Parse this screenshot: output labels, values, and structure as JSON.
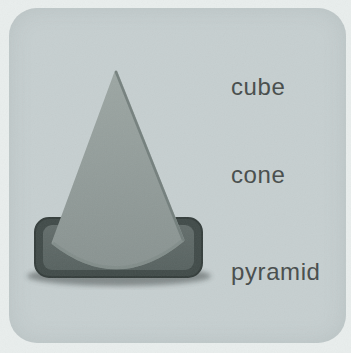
{
  "page": {
    "background_color": "#e9eeed"
  },
  "card": {
    "background_color": "#c6cfd0",
    "corner_radius_px": 28
  },
  "figure": {
    "depicts": "traffic-cone shape (cone on rounded rectangular base)",
    "colors": {
      "cone_top": "#9ca6a3",
      "cone_bottom": "#899391",
      "cone_edge": "#6f7a78",
      "base_outer": "#414b49",
      "base_outer_stroke": "#343d3b",
      "base_inner": "#5e6866",
      "shadow": "#2e3534"
    }
  },
  "options": [
    {
      "id": "cube",
      "label": "cube"
    },
    {
      "id": "cone",
      "label": "cone"
    },
    {
      "id": "pyramid",
      "label": "pyramid"
    }
  ],
  "text_color": "#474c4b"
}
